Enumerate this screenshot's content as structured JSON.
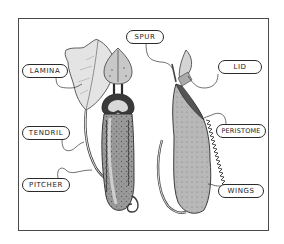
{
  "diagram": {
    "views": [
      "front-section",
      "side-exterior"
    ],
    "labels": {
      "lamina": "LAMINA",
      "spur": "SPUR",
      "lid": "LID",
      "tendril": "TENDRIL",
      "peristome": "PERISTOME",
      "pitcher": "PITCHER",
      "wings": "WINGS"
    }
  }
}
